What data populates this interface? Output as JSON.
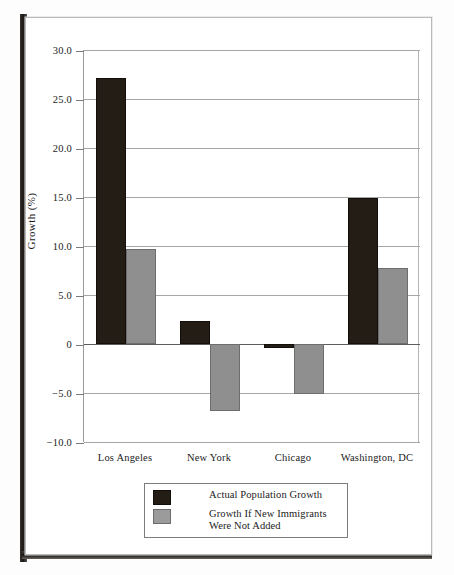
{
  "chart_data": {
    "type": "bar",
    "title": "",
    "subtitle": "",
    "xlabel": "",
    "ylabel": "Growth (%)",
    "categories": [
      "Los Angeles",
      "New York",
      "Chicago",
      "Washington, DC"
    ],
    "series": [
      {
        "name": "Actual Population Growth",
        "color": "#241d16",
        "values": [
          27.1,
          2.3,
          -0.4,
          14.9
        ]
      },
      {
        "name": "Growth If New Immigrants Were Not Added",
        "color": "#8f8f8f",
        "values": [
          9.7,
          -6.8,
          -5.1,
          7.8
        ]
      }
    ],
    "ylim": [
      -10.0,
      30.0
    ],
    "yticks": [
      30.0,
      25.0,
      20.0,
      15.0,
      10.0,
      5.0,
      0,
      -5.0,
      -10.0
    ],
    "ytick_labels": [
      "30.0",
      "25.0",
      "20.0",
      "15.0",
      "10.0",
      "5.0",
      "0",
      "−5.0",
      "−10.0"
    ],
    "grid": true,
    "legend_position": "bottom-center",
    "legend": [
      {
        "label": "Actual Population Growth",
        "color": "#241d16"
      },
      {
        "label": "Growth If New Immigrants Were Not Added",
        "color": "#8f8f8f"
      }
    ]
  },
  "legend_lines": {
    "series0": [
      "Actual Population Growth"
    ],
    "series1": [
      "Growth If New Immigrants",
      "Were Not Added"
    ]
  }
}
